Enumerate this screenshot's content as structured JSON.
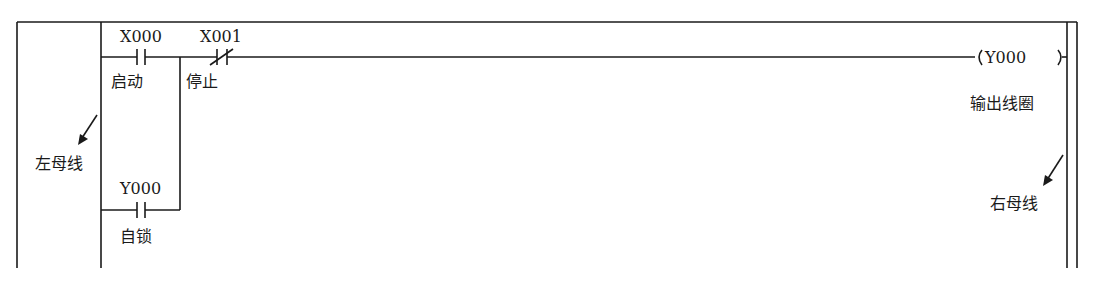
{
  "diagram": {
    "type": "PLC ladder diagram (start/stop self-locking circuit)",
    "contacts": [
      {
        "id": "X000",
        "type": "normally-open",
        "label": "X000",
        "caption": "启动"
      },
      {
        "id": "X001",
        "type": "normally-closed",
        "label": "X001",
        "caption": "停止"
      },
      {
        "id": "Y000_self",
        "type": "normally-open",
        "label": "Y000",
        "caption": "自锁"
      }
    ],
    "coil": {
      "label": "Y000",
      "caption": "输出线圈"
    },
    "left_bus_label": "左母线",
    "right_bus_label": "右母线"
  }
}
